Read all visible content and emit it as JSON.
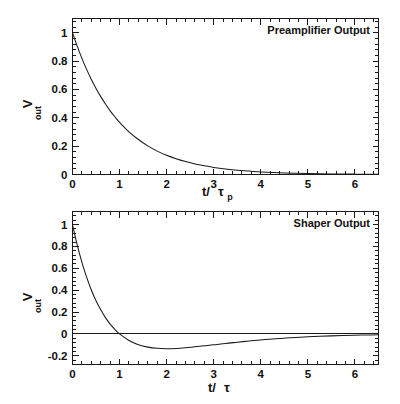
{
  "figure": {
    "background_color": "#ffffff",
    "ink_color": "#1a1a1a",
    "panels": [
      {
        "id": "preamplifier",
        "label": "Preamplifier Output",
        "ylabel_main": "V",
        "ylabel_sub": "out",
        "xlabel_main": "t/",
        "xlabel_tau": "τ",
        "xlabel_sub": "p"
      },
      {
        "id": "shaper",
        "label": "Shaper Output",
        "ylabel_main": "V",
        "ylabel_sub": "out",
        "xlabel_main": "t/",
        "xlabel_tau": "τ",
        "xlabel_sub": ""
      }
    ]
  },
  "chart_data": [
    {
      "type": "line",
      "id": "preamplifier",
      "title": "Preamplifier Output",
      "xlabel": "t/τ_p",
      "ylabel": "V_out",
      "xlim": [
        0,
        6.5
      ],
      "ylim": [
        0,
        1.1
      ],
      "grid": false,
      "legend": "none",
      "annotation": "Preamplifier Output",
      "annotation_position": "top-right inside frame",
      "xticks": [
        0,
        1,
        2,
        3,
        4,
        5,
        6
      ],
      "xtick_labels": [
        "0",
        "1",
        "2",
        "3",
        "4",
        "5",
        "6"
      ],
      "x_minor_ticks_per_interval": 5,
      "yticks": [
        0,
        0.2,
        0.4,
        0.6,
        0.8,
        1
      ],
      "ytick_labels": [
        "0",
        "0.2",
        "0.4",
        "0.6",
        "0.8",
        "1"
      ],
      "y_minor_ticks_per_interval": 5,
      "equation": "V_out = exp(-t/tau_p)",
      "series": [
        {
          "name": "Preamplifier exponential decay",
          "color": "#1a1a1a",
          "x": [
            0,
            0.1,
            0.2,
            0.3,
            0.4,
            0.5,
            0.6,
            0.7,
            0.8,
            0.9,
            1.0,
            1.2,
            1.4,
            1.6,
            1.8,
            2.0,
            2.2,
            2.4,
            2.6,
            2.8,
            3.0,
            3.25,
            3.5,
            3.75,
            4.0,
            4.25,
            4.5,
            4.75,
            5.0,
            5.25,
            5.5,
            5.75,
            6.0,
            6.25,
            6.5
          ],
          "y": [
            1.0,
            0.905,
            0.819,
            0.741,
            0.67,
            0.607,
            0.549,
            0.497,
            0.449,
            0.407,
            0.368,
            0.301,
            0.247,
            0.202,
            0.165,
            0.135,
            0.111,
            0.091,
            0.074,
            0.061,
            0.05,
            0.039,
            0.03,
            0.024,
            0.018,
            0.014,
            0.011,
            0.0087,
            0.0067,
            0.0052,
            0.0041,
            0.0032,
            0.0025,
            0.0019,
            0.0015
          ]
        }
      ]
    },
    {
      "type": "line",
      "id": "shaper",
      "title": "Shaper Output",
      "xlabel": "t/τ",
      "ylabel": "V_out",
      "xlim": [
        0,
        6.5
      ],
      "ylim": [
        -0.28,
        1.12
      ],
      "grid": false,
      "legend": "none",
      "annotation": "Shaper Output",
      "annotation_position": "top-right inside frame",
      "xticks": [
        0,
        1,
        2,
        3,
        4,
        5,
        6
      ],
      "xtick_labels": [
        "0",
        "1",
        "2",
        "3",
        "4",
        "5",
        "6"
      ],
      "x_minor_ticks_per_interval": 5,
      "yticks": [
        -0.2,
        0,
        0.2,
        0.4,
        0.6,
        0.8,
        1
      ],
      "ytick_labels": [
        "-0.2",
        "0",
        "0.2",
        "0.4",
        "0.6",
        "0.8",
        "1"
      ],
      "y_minor_ticks_per_interval": 5,
      "zero_reference_line": 0,
      "equation": "V_out = (1 - t/tau) * exp(-t/tau)",
      "zero_crossing": 1.0,
      "minimum_x": 2.0,
      "minimum_y": -0.135,
      "series": [
        {
          "name": "Shaper bipolar response",
          "color": "#1a1a1a",
          "x": [
            0,
            0.1,
            0.2,
            0.3,
            0.4,
            0.5,
            0.6,
            0.7,
            0.8,
            0.9,
            1.0,
            1.2,
            1.4,
            1.6,
            1.8,
            2.0,
            2.2,
            2.4,
            2.6,
            2.8,
            3.0,
            3.25,
            3.5,
            3.75,
            4.0,
            4.25,
            4.5,
            4.75,
            5.0,
            5.25,
            5.5,
            5.75,
            6.0,
            6.25,
            6.5
          ],
          "y": [
            1.0,
            0.814,
            0.655,
            0.519,
            0.402,
            0.303,
            0.22,
            0.149,
            0.09,
            0.041,
            0.0,
            -0.06,
            -0.099,
            -0.121,
            -0.132,
            -0.135,
            -0.133,
            -0.127,
            -0.118,
            -0.109,
            -0.1,
            -0.087,
            -0.076,
            -0.065,
            -0.055,
            -0.046,
            -0.039,
            -0.033,
            -0.027,
            -0.022,
            -0.018,
            -0.015,
            -0.012,
            -0.01,
            -0.008
          ]
        }
      ]
    }
  ]
}
